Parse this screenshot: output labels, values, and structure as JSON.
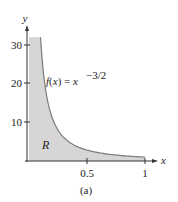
{
  "chart_data": {
    "type": "area",
    "title": "",
    "caption": "(a)",
    "xlabel": "x",
    "ylabel": "y",
    "xlim": [
      0,
      1.05
    ],
    "ylim": [
      0,
      33
    ],
    "x_ticks": [
      0.5,
      1
    ],
    "x_tick_labels": [
      "0.5",
      "1"
    ],
    "y_ticks": [
      10,
      20,
      30
    ],
    "y_tick_labels": [
      "10",
      "20",
      "30"
    ],
    "grid": false,
    "legend": null,
    "function_label": "f(x) = x",
    "function_exponent": "−3/2",
    "region_label": "R",
    "series": [
      {
        "name": "f(x) = x^(-3/2)",
        "x": [
          0.1,
          0.12,
          0.15,
          0.2,
          0.25,
          0.3,
          0.4,
          0.5,
          0.6,
          0.7,
          0.8,
          0.9,
          1.0
        ],
        "y": [
          31.6,
          24.1,
          17.2,
          11.2,
          8.0,
          6.1,
          4.0,
          2.83,
          2.15,
          1.71,
          1.4,
          1.17,
          1.0
        ]
      }
    ],
    "shaded_region": {
      "description": "Region R under the curve, above x-axis, from x=0 to x=1, truncated at top y≈32",
      "fill_color": "#d6d6d6",
      "curve_color": "#7a7a7a"
    }
  }
}
